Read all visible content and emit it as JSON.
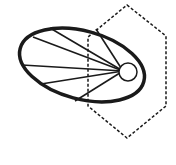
{
  "diagram": {
    "background": "#ffffff",
    "stroke_color": "#1a1a1a",
    "ellipse": {
      "cx": 82,
      "cy": 65,
      "rx": 64,
      "ry": 34,
      "rotation_deg": 15,
      "stroke_width": 3.5
    },
    "focal_point": {
      "x": 123,
      "y": 71
    },
    "small_circle": {
      "cx": 128,
      "cy": 72,
      "r": 9,
      "stroke_width": 1.5
    },
    "rays": [
      {
        "x": 50,
        "y": 28
      },
      {
        "x": 33,
        "y": 37
      },
      {
        "x": 22,
        "y": 65
      },
      {
        "x": 41,
        "y": 84
      },
      {
        "x": 75,
        "y": 101
      },
      {
        "x": 96,
        "y": 29
      }
    ],
    "ray_stroke_width": 1.6,
    "hexagon": {
      "points": [
        [
          127,
          5
        ],
        [
          166,
          36
        ],
        [
          166,
          106
        ],
        [
          127,
          138
        ],
        [
          88,
          106
        ],
        [
          88,
          37
        ]
      ],
      "stroke_width": 1.5,
      "dash": "3,2"
    }
  }
}
